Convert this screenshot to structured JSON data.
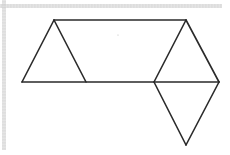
{
  "diagram": {
    "type": "geometric-net",
    "stroke_color": "#2a2a2a",
    "stroke_width": 1.6,
    "background": "#ffffff",
    "vertices": {
      "A_top_left": [
        54,
        20
      ],
      "B_top_right": [
        186,
        20
      ],
      "C_base_left": [
        22,
        82
      ],
      "D_base_mid_left": [
        86,
        82
      ],
      "E_base_mid_right": [
        154,
        82
      ],
      "F_base_right": [
        219,
        82
      ],
      "G_bottom": [
        186,
        145
      ]
    },
    "segments": [
      {
        "name": "top-edge",
        "from": "A_top_left",
        "to": "B_top_right"
      },
      {
        "name": "base-edge",
        "from": "C_base_left",
        "to": "F_base_right"
      },
      {
        "name": "left-triangle-left-side",
        "from": "C_base_left",
        "to": "A_top_left"
      },
      {
        "name": "left-triangle-right-side",
        "from": "A_top_left",
        "to": "D_base_mid_left"
      },
      {
        "name": "right-triangle-left-side",
        "from": "E_base_mid_right",
        "to": "B_top_right"
      },
      {
        "name": "right-triangle-right-side",
        "from": "B_top_right",
        "to": "F_base_right"
      },
      {
        "name": "bottom-triangle-left-side",
        "from": "E_base_mid_right",
        "to": "G_bottom"
      },
      {
        "name": "bottom-triangle-right-side",
        "from": "F_base_right",
        "to": "G_bottom"
      }
    ],
    "shapes": [
      {
        "name": "left-triangle",
        "points": [
          "A_top_left",
          "C_base_left",
          "D_base_mid_left"
        ]
      },
      {
        "name": "right-triangle",
        "points": [
          "B_top_right",
          "E_base_mid_right",
          "F_base_right"
        ]
      },
      {
        "name": "bottom-triangle",
        "points": [
          "E_base_mid_right",
          "F_base_right",
          "G_bottom"
        ]
      },
      {
        "name": "center-quadrilateral",
        "points": [
          "A_top_left",
          "B_top_right",
          "E_base_mid_right",
          "D_base_mid_left"
        ]
      }
    ]
  }
}
